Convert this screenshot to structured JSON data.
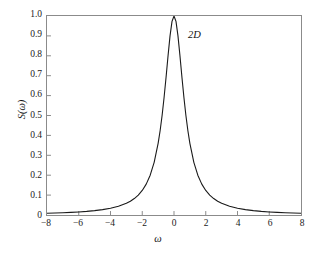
{
  "chart_data": {
    "type": "line",
    "title": "",
    "subtitle": "",
    "xlabel": "ω",
    "ylabel": "S(ω)",
    "xlim": [
      -8,
      8
    ],
    "ylim": [
      0,
      1.0
    ],
    "grid": false,
    "legend": null,
    "xticks": [
      -8,
      -6,
      -4,
      -2,
      0,
      2,
      4,
      6,
      8
    ],
    "xtick_labels": [
      "−8",
      "−6",
      "−4",
      "−2",
      "0",
      "2",
      "4",
      "6",
      "8"
    ],
    "yticks": [
      0,
      0.1,
      0.2,
      0.3,
      0.4,
      0.5,
      0.6,
      0.7,
      0.8,
      0.9,
      1.0
    ],
    "ytick_labels": [
      "0",
      "0.1",
      "0.2",
      "0.3",
      "0.4",
      "0.5",
      "0.6",
      "0.7",
      "0.8",
      "0.9",
      "1.0"
    ],
    "annotations": [
      {
        "text": "2D",
        "x": 0.75,
        "y": 0.9,
        "style": "italic"
      }
    ],
    "series": [
      {
        "name": "S(ω)",
        "color": "#1a1a1a",
        "linewidth": 1.1,
        "curve": "lorentzian",
        "peak_value": 1.0,
        "peak_x": 0,
        "half_width_half_max": 0.75,
        "x": [
          -8.0,
          -7.5,
          -7.0,
          -6.5,
          -6.0,
          -5.5,
          -5.0,
          -4.5,
          -4.0,
          -3.5,
          -3.0,
          -2.75,
          -2.5,
          -2.25,
          -2.0,
          -1.75,
          -1.5,
          -1.25,
          -1.0,
          -0.875,
          -0.75,
          -0.625,
          -0.5,
          -0.375,
          -0.25,
          -0.125,
          0.0,
          0.125,
          0.25,
          0.375,
          0.5,
          0.625,
          0.75,
          0.875,
          1.0,
          1.25,
          1.5,
          1.75,
          2.0,
          2.25,
          2.5,
          2.75,
          3.0,
          3.5,
          4.0,
          4.5,
          5.0,
          5.5,
          6.0,
          6.5,
          7.0,
          7.5,
          8.0
        ],
        "y": [
          0.0087,
          0.0099,
          0.0113,
          0.0131,
          0.0154,
          0.0182,
          0.022,
          0.027,
          0.034,
          0.0441,
          0.0588,
          0.0692,
          0.0826,
          0.1,
          0.1233,
          0.1552,
          0.2,
          0.2647,
          0.36,
          0.4235,
          0.5,
          0.5902,
          0.6923,
          0.8,
          0.9,
          0.973,
          1.0,
          0.973,
          0.9,
          0.8,
          0.6923,
          0.5902,
          0.5,
          0.4235,
          0.36,
          0.2647,
          0.2,
          0.1552,
          0.1233,
          0.1,
          0.0826,
          0.0692,
          0.0588,
          0.0441,
          0.034,
          0.027,
          0.022,
          0.0182,
          0.0154,
          0.0131,
          0.0113,
          0.0099,
          0.0087
        ]
      }
    ]
  }
}
